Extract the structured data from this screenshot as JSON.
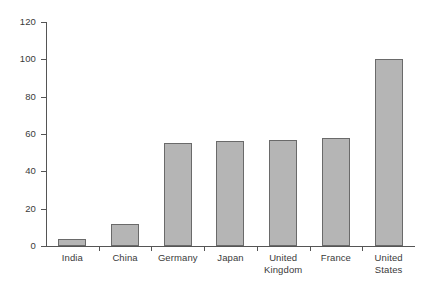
{
  "chart_data": {
    "type": "bar",
    "title": "",
    "subtitle": "",
    "xlabel": "",
    "ylabel": "",
    "categories": [
      "India",
      "China",
      "Germany",
      "Japan",
      "United\nKingdom",
      "France",
      "United\nStates"
    ],
    "values": [
      4,
      12,
      55,
      56,
      57,
      58,
      100
    ],
    "ylim": [
      0,
      120
    ],
    "yticks": [
      0,
      20,
      40,
      60,
      80,
      100,
      120
    ],
    "ytick_labels": [
      "0",
      "20",
      "40",
      "60",
      "80",
      "100",
      "120"
    ],
    "xticks_between_categories": true,
    "grid": false,
    "legend": false,
    "legend_position": "none",
    "colors": {
      "bar_fill": "#b5b5b5",
      "bar_border": "#6a6a6a",
      "axis": "#555555",
      "text": "#3a3a3a",
      "background": "#ffffff"
    }
  }
}
